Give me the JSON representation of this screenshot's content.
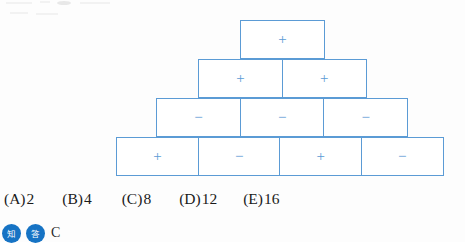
{
  "figure": {
    "name": "sign-pyramid-diagram",
    "border_color": "#5b9bd5",
    "sign_color": "#5b9bd5",
    "rows": [
      {
        "index": 1,
        "cells": [
          {
            "sign": "+"
          }
        ]
      },
      {
        "index": 2,
        "cells": [
          {
            "sign": "+"
          },
          {
            "sign": "+"
          }
        ]
      },
      {
        "index": 3,
        "cells": [
          {
            "sign": "−"
          },
          {
            "sign": "−"
          },
          {
            "sign": "−"
          }
        ]
      },
      {
        "index": 4,
        "cells": [
          {
            "sign": "+"
          },
          {
            "sign": "−"
          },
          {
            "sign": "+"
          },
          {
            "sign": "−"
          }
        ]
      }
    ]
  },
  "choices": [
    {
      "tag": "(A)",
      "value": "2"
    },
    {
      "tag": "(B)",
      "value": "4"
    },
    {
      "tag": "(C)",
      "value": "8"
    },
    {
      "tag": "(D)",
      "value": "12"
    },
    {
      "tag": "(E)",
      "value": "16"
    }
  ],
  "footer": {
    "badges": [
      {
        "label": "知",
        "color": "#1673c4"
      },
      {
        "label": "答",
        "color": "#1673c4"
      }
    ],
    "letter": "C"
  }
}
